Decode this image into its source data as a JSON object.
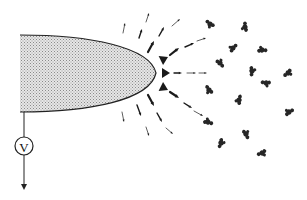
{
  "diagram": {
    "colors": {
      "stroke": "#222222",
      "tip_fill": "#cfcfcf",
      "ion": "#1a1a1a",
      "molecule": "#262626"
    },
    "tip": {
      "base_x": 20,
      "top_y": 35,
      "bottom_y": 112,
      "apex_x": 156,
      "apex_y": 73
    },
    "meter": {
      "label": "V",
      "cx": 24,
      "cy": 146,
      "r": 9
    },
    "wire": {
      "x": 24,
      "y1": 112,
      "y2": 190
    },
    "ions": [
      {
        "x1": 158,
        "y1": 62,
        "x2": 168,
        "y2": 57,
        "size": "xl"
      },
      {
        "x1": 158,
        "y1": 73,
        "x2": 170,
        "y2": 73,
        "size": "xl"
      },
      {
        "x1": 158,
        "y1": 85,
        "x2": 168,
        "y2": 90,
        "size": "xl"
      },
      {
        "x1": 148,
        "y1": 52,
        "x2": 154,
        "y2": 41,
        "size": "l"
      },
      {
        "x1": 170,
        "y1": 55,
        "x2": 179,
        "y2": 48,
        "size": "l"
      },
      {
        "x1": 174,
        "y1": 73,
        "x2": 182,
        "y2": 73,
        "size": "m"
      },
      {
        "x1": 170,
        "y1": 92,
        "x2": 179,
        "y2": 98,
        "size": "l"
      },
      {
        "x1": 148,
        "y1": 95,
        "x2": 154,
        "y2": 106,
        "size": "l"
      },
      {
        "x1": 139,
        "y1": 38,
        "x2": 142,
        "y2": 29,
        "size": "m"
      },
      {
        "x1": 159,
        "y1": 36,
        "x2": 164,
        "y2": 27,
        "size": "m"
      },
      {
        "x1": 185,
        "y1": 47,
        "x2": 194,
        "y2": 43,
        "size": "m"
      },
      {
        "x1": 187,
        "y1": 73,
        "x2": 196,
        "y2": 73,
        "size": "s"
      },
      {
        "x1": 184,
        "y1": 103,
        "x2": 192,
        "y2": 108,
        "size": "m"
      },
      {
        "x1": 137,
        "y1": 105,
        "x2": 141,
        "y2": 116,
        "size": "m"
      },
      {
        "x1": 157,
        "y1": 113,
        "x2": 162,
        "y2": 122,
        "size": "m"
      },
      {
        "x1": 123,
        "y1": 33,
        "x2": 125,
        "y2": 23,
        "size": "s"
      },
      {
        "x1": 146,
        "y1": 22,
        "x2": 149,
        "y2": 13,
        "size": "s"
      },
      {
        "x1": 172,
        "y1": 26,
        "x2": 180,
        "y2": 19,
        "size": "s"
      },
      {
        "x1": 197,
        "y1": 41,
        "x2": 206,
        "y2": 38,
        "size": "s"
      },
      {
        "x1": 199,
        "y1": 73,
        "x2": 207,
        "y2": 73,
        "size": "s"
      },
      {
        "x1": 194,
        "y1": 111,
        "x2": 203,
        "y2": 116,
        "size": "s"
      },
      {
        "x1": 122,
        "y1": 112,
        "x2": 124,
        "y2": 122,
        "size": "s"
      },
      {
        "x1": 146,
        "y1": 127,
        "x2": 149,
        "y2": 136,
        "size": "s"
      },
      {
        "x1": 166,
        "y1": 128,
        "x2": 173,
        "y2": 134,
        "size": "s"
      }
    ],
    "molecules": [
      {
        "x": 210,
        "y": 24
      },
      {
        "x": 245,
        "y": 27
      },
      {
        "x": 233,
        "y": 48
      },
      {
        "x": 262,
        "y": 50
      },
      {
        "x": 220,
        "y": 63
      },
      {
        "x": 252,
        "y": 71
      },
      {
        "x": 288,
        "y": 73
      },
      {
        "x": 266,
        "y": 83
      },
      {
        "x": 209,
        "y": 90
      },
      {
        "x": 239,
        "y": 100
      },
      {
        "x": 289,
        "y": 112
      },
      {
        "x": 208,
        "y": 122
      },
      {
        "x": 246,
        "y": 134
      },
      {
        "x": 221,
        "y": 143
      },
      {
        "x": 262,
        "y": 153
      }
    ]
  }
}
